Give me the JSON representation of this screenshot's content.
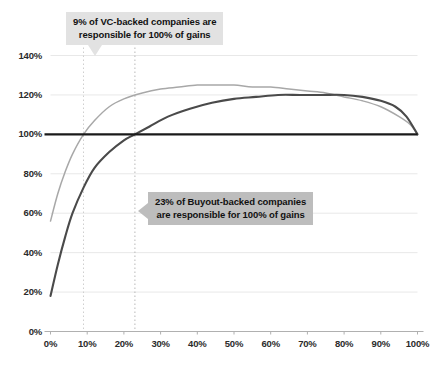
{
  "chart_data": {
    "type": "line",
    "title": "",
    "subtitle": "",
    "xlabel": "",
    "ylabel": "",
    "xlim": [
      0,
      100
    ],
    "ylim": [
      0,
      140
    ],
    "grid": true,
    "legend_position": "none",
    "x_ticks": [
      "0%",
      "10%",
      "20%",
      "30%",
      "40%",
      "50%",
      "60%",
      "70%",
      "80%",
      "90%",
      "100%"
    ],
    "y_ticks": [
      "0%",
      "20%",
      "40%",
      "60%",
      "80%",
      "100%",
      "120%",
      "140%"
    ],
    "reference_lines": [
      {
        "name": "hundred-percent-line",
        "orientation": "horizontal",
        "value": 100,
        "color": "#1a1a1a",
        "style": "solid"
      },
      {
        "name": "vc-breakeven-line",
        "orientation": "vertical",
        "value": 9,
        "color": "#cfcfcf",
        "style": "dotted"
      },
      {
        "name": "buyout-breakeven-line",
        "orientation": "vertical",
        "value": 23,
        "color": "#b8b8b8",
        "style": "dotted"
      }
    ],
    "series": [
      {
        "name": "VC-backed cumulative gains",
        "color": "#a8a8a8",
        "x": [
          0,
          2,
          4,
          6,
          9,
          12,
          16,
          20,
          25,
          30,
          35,
          40,
          45,
          50,
          55,
          60,
          65,
          70,
          75,
          80,
          85,
          90,
          95,
          98,
          100
        ],
        "values": [
          56,
          70,
          81,
          90,
          100,
          107,
          114,
          118,
          121,
          123,
          124,
          125,
          125,
          125,
          124,
          124,
          123,
          122,
          121,
          119,
          117,
          114,
          109,
          105,
          100
        ]
      },
      {
        "name": "Buyout-backed cumulative gains",
        "color": "#4a4a4a",
        "x": [
          0,
          2,
          4,
          6,
          9,
          12,
          16,
          20,
          23,
          27,
          32,
          38,
          44,
          50,
          56,
          62,
          68,
          74,
          80,
          85,
          90,
          94,
          97,
          100
        ],
        "values": [
          18,
          34,
          48,
          60,
          73,
          83,
          91,
          97,
          100,
          104,
          109,
          113,
          116,
          118,
          119,
          120,
          120,
          120,
          120,
          119,
          117,
          114,
          109,
          100
        ]
      }
    ],
    "annotations": [
      {
        "name": "vc-callout",
        "lines": [
          "9% of VC-backed companies are",
          "responsible for 100% of gains"
        ],
        "target_x": 9,
        "pointer": "down",
        "background": "#e2e2e2"
      },
      {
        "name": "buyout-callout",
        "lines": [
          "23% of Buyout-backed companies",
          "are responsible for 100% of gains"
        ],
        "target_x": 23,
        "pointer": "left",
        "background": "#bdbdbd"
      }
    ]
  },
  "axes": {
    "y_labels": [
      {
        "text": "140%",
        "value": 140
      },
      {
        "text": "120%",
        "value": 120
      },
      {
        "text": "100%",
        "value": 100
      },
      {
        "text": "80%",
        "value": 80
      },
      {
        "text": "60%",
        "value": 60
      },
      {
        "text": "40%",
        "value": 40
      },
      {
        "text": "20%",
        "value": 20
      },
      {
        "text": "0%",
        "value": 0
      }
    ],
    "x_labels": [
      {
        "text": "0%",
        "value": 0
      },
      {
        "text": "10%",
        "value": 10
      },
      {
        "text": "20%",
        "value": 20
      },
      {
        "text": "30%",
        "value": 30
      },
      {
        "text": "40%",
        "value": 40
      },
      {
        "text": "50%",
        "value": 50
      },
      {
        "text": "60%",
        "value": 60
      },
      {
        "text": "70%",
        "value": 70
      },
      {
        "text": "80%",
        "value": 80
      },
      {
        "text": "90%",
        "value": 90
      },
      {
        "text": "100%",
        "value": 100
      }
    ]
  },
  "callouts": {
    "vc": {
      "line1": "9% of VC-backed companies are",
      "line2": "responsible for 100% of gains"
    },
    "buyout": {
      "line1": "23% of Buyout-backed companies",
      "line2": "are responsible for 100% of gains"
    }
  },
  "colors": {
    "vc_line": "#a8a8a8",
    "buyout_line": "#4a4a4a",
    "baseline": "#1a1a1a",
    "grid": "#e8e8e8",
    "axis": "#b0b0b0",
    "callout_vc_bg": "#e2e2e2",
    "callout_buyout_bg": "#bdbdbd"
  }
}
